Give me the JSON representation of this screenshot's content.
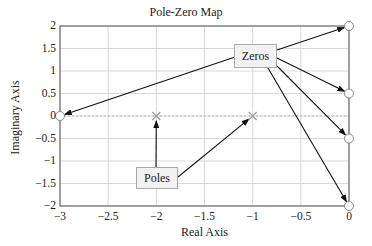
{
  "chart_data": {
    "type": "scatter",
    "title": "Pole-Zero Map",
    "xlabel": "Real Axis",
    "ylabel": "Imaginary Axis",
    "xlim": [
      -3,
      0
    ],
    "ylim": [
      -2,
      2
    ],
    "x_ticks": [
      "−3",
      "−2.5",
      "−2",
      "−1.5",
      "−1",
      "−0.5",
      "0"
    ],
    "y_ticks": [
      "2",
      "1.5",
      "1",
      "0.5",
      "0",
      "−0.5",
      "−1",
      "−1.5",
      "−2"
    ],
    "grid": true,
    "series": [
      {
        "name": "Poles",
        "marker": "x",
        "points": [
          [
            -2,
            0
          ],
          [
            -1,
            0
          ]
        ]
      },
      {
        "name": "Zeros",
        "marker": "o",
        "points": [
          [
            -3,
            0
          ],
          [
            0,
            2
          ],
          [
            0,
            0.5
          ],
          [
            0,
            -0.5
          ],
          [
            0,
            -2
          ]
        ]
      }
    ],
    "annotations": [
      {
        "label": "Zeros",
        "points_to": [
          [
            -3,
            0
          ],
          [
            0,
            2
          ],
          [
            0,
            0.5
          ],
          [
            0,
            -0.5
          ],
          [
            0,
            -2
          ]
        ]
      },
      {
        "label": "Poles",
        "points_to": [
          [
            -2,
            0
          ],
          [
            -1,
            0
          ]
        ]
      }
    ]
  },
  "labels": {
    "title": "Pole-Zero Map",
    "xlabel": "Real Axis",
    "ylabel": "Imaginary Axis",
    "zeros": "Zeros",
    "poles": "Poles"
  },
  "ticks": {
    "x": [
      "−3",
      "−2.5",
      "−2",
      "−1.5",
      "−1",
      "−0.5",
      "0"
    ],
    "y": [
      "2",
      "1.5",
      "1",
      "0.5",
      "0",
      "−0.5",
      "−1",
      "−1.5",
      "−2"
    ]
  }
}
